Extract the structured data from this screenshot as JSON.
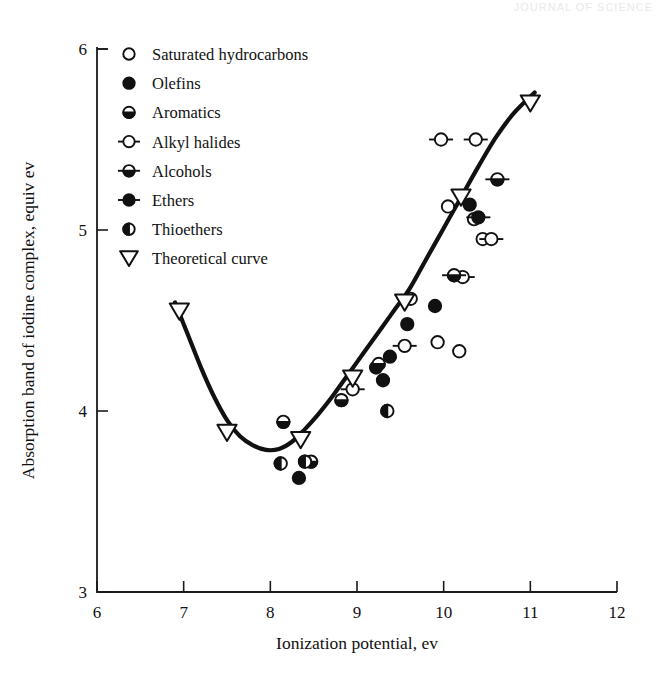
{
  "figure": {
    "background": "#ffffff",
    "ink": "#111111",
    "faint_header": "JOURNAL OF SCIENCE"
  },
  "chart_data": {
    "type": "scatter",
    "title": "",
    "xlabel": "Ionization potential, ev",
    "ylabel": "Absorption band of iodine complex, equiv ev",
    "xlim": [
      6,
      12
    ],
    "ylim": [
      3,
      6
    ],
    "xticks": [
      6,
      7,
      8,
      9,
      10,
      11,
      12
    ],
    "yticks": [
      3,
      4,
      5,
      6
    ],
    "xtick_labels": [
      "6",
      "7",
      "8",
      "9",
      "10",
      "11",
      "12"
    ],
    "ytick_labels": [
      "3",
      "4",
      "5",
      "6"
    ],
    "grid": false,
    "legend_position": "upper-left-inside",
    "series": [
      {
        "name": "Saturated hydrocarbons",
        "marker": "open-circle",
        "points": [
          [
            9.62,
            4.62
          ],
          [
            9.93,
            4.38
          ],
          [
            10.05,
            5.13
          ],
          [
            10.18,
            4.33
          ],
          [
            10.35,
            5.06
          ],
          [
            10.45,
            4.95
          ]
        ]
      },
      {
        "name": "Olefins",
        "marker": "filled-circle",
        "points": [
          [
            8.33,
            3.63
          ],
          [
            9.22,
            4.24
          ],
          [
            9.3,
            4.17
          ],
          [
            9.38,
            4.3
          ],
          [
            9.58,
            4.48
          ],
          [
            9.9,
            4.58
          ],
          [
            10.3,
            5.14
          ]
        ]
      },
      {
        "name": "Aromatics",
        "marker": "bottom-half-circle",
        "points": [
          [
            8.15,
            3.94
          ],
          [
            8.47,
            3.72
          ],
          [
            8.82,
            4.06
          ],
          [
            9.25,
            4.26
          ]
        ]
      },
      {
        "name": "Alkyl halides",
        "marker": "open-circle-bar",
        "points": [
          [
            8.95,
            4.12
          ],
          [
            9.55,
            4.36
          ],
          [
            9.97,
            5.5
          ],
          [
            10.22,
            4.74
          ],
          [
            10.37,
            5.5
          ],
          [
            10.55,
            4.95
          ]
        ]
      },
      {
        "name": "Alcohols",
        "marker": "half-circle-bar",
        "points": [
          [
            10.12,
            4.75
          ],
          [
            10.62,
            5.28
          ]
        ]
      },
      {
        "name": "Ethers",
        "marker": "filled-circle-bar",
        "points": [
          [
            10.4,
            5.07
          ]
        ]
      },
      {
        "name": "Thioethers",
        "marker": "left-half-circle",
        "points": [
          [
            8.12,
            3.71
          ],
          [
            8.4,
            3.72
          ],
          [
            9.35,
            4.0
          ]
        ]
      },
      {
        "name": "Theoretical curve",
        "marker": "open-down-triangle",
        "points": [
          [
            6.95,
            4.55
          ],
          [
            7.5,
            3.88
          ],
          [
            8.35,
            3.84
          ],
          [
            8.95,
            4.18
          ],
          [
            9.55,
            4.6
          ],
          [
            10.2,
            5.18
          ],
          [
            11.0,
            5.7
          ]
        ]
      }
    ],
    "curve": {
      "name": "Theoretical curve",
      "style": "solid-thick",
      "points": [
        [
          6.9,
          4.6
        ],
        [
          7.05,
          4.42
        ],
        [
          7.2,
          4.24
        ],
        [
          7.35,
          4.08
        ],
        [
          7.5,
          3.95
        ],
        [
          7.65,
          3.86
        ],
        [
          7.8,
          3.81
        ],
        [
          7.95,
          3.785
        ],
        [
          8.1,
          3.79
        ],
        [
          8.25,
          3.83
        ],
        [
          8.4,
          3.9
        ],
        [
          8.55,
          3.98
        ],
        [
          8.7,
          4.07
        ],
        [
          8.85,
          4.17
        ],
        [
          9.0,
          4.27
        ],
        [
          9.15,
          4.37
        ],
        [
          9.3,
          4.47
        ],
        [
          9.45,
          4.57
        ],
        [
          9.6,
          4.67
        ],
        [
          9.8,
          4.84
        ],
        [
          10.0,
          5.01
        ],
        [
          10.2,
          5.18
        ],
        [
          10.4,
          5.35
        ],
        [
          10.6,
          5.51
        ],
        [
          10.8,
          5.64
        ],
        [
          11.05,
          5.76
        ]
      ]
    }
  },
  "legend": {
    "items": [
      {
        "label": "Saturated hydrocarbons",
        "marker": "open-circle"
      },
      {
        "label": "Olefins",
        "marker": "filled-circle"
      },
      {
        "label": "Aromatics",
        "marker": "bottom-half-circle"
      },
      {
        "label": "Alkyl halides",
        "marker": "open-circle-bar"
      },
      {
        "label": "Alcohols",
        "marker": "half-circle-bar"
      },
      {
        "label": "Ethers",
        "marker": "filled-circle-bar"
      },
      {
        "label": "Thioethers",
        "marker": "left-half-circle"
      },
      {
        "label": "Theoretical curve",
        "marker": "open-down-triangle"
      }
    ]
  }
}
